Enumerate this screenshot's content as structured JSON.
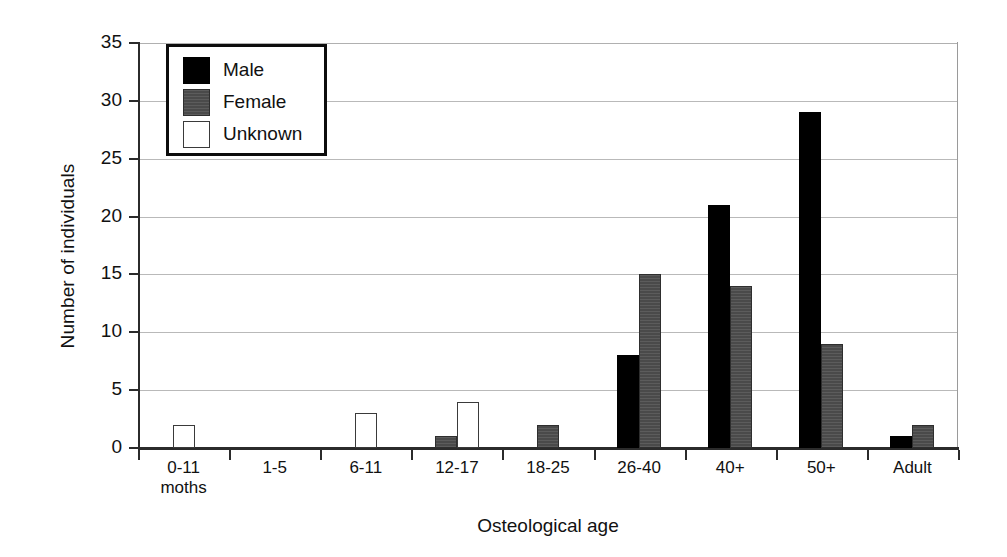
{
  "chart_data": {
    "type": "bar",
    "title": "",
    "xlabel": "Osteological age",
    "ylabel": "Number of individuals",
    "ylim": [
      0,
      35
    ],
    "ytick_labels": [
      "0",
      "5",
      "10",
      "15",
      "20",
      "25",
      "30",
      "35"
    ],
    "ytick_values": [
      0,
      5,
      10,
      15,
      20,
      25,
      30,
      35
    ],
    "grid": "horizontal",
    "legend_position": "top-left",
    "categories": [
      "0-11\nmoths",
      "1-5",
      "6-11",
      "12-17",
      "18-25",
      "26-40",
      "40+",
      "50+",
      "Adult"
    ],
    "category_labels": [
      {
        "line1": "0-11",
        "line2": "moths"
      },
      {
        "line1": "1-5",
        "line2": ""
      },
      {
        "line1": "6-11",
        "line2": ""
      },
      {
        "line1": "12-17",
        "line2": ""
      },
      {
        "line1": "18-25",
        "line2": ""
      },
      {
        "line1": "26-40",
        "line2": ""
      },
      {
        "line1": "40+",
        "line2": ""
      },
      {
        "line1": "50+",
        "line2": ""
      },
      {
        "line1": "Adult",
        "line2": ""
      }
    ],
    "series": [
      {
        "name": "Male",
        "color": "#000000",
        "values": [
          0,
          0,
          0,
          0,
          0,
          8,
          21,
          29,
          1
        ]
      },
      {
        "name": "Female",
        "color": "#4a4a4a",
        "values": [
          0,
          0,
          0,
          1,
          2,
          15,
          14,
          9,
          2
        ]
      },
      {
        "name": "Unknown",
        "color": "#ffffff",
        "values": [
          2,
          0,
          3,
          4,
          0,
          0,
          0,
          0,
          0
        ]
      }
    ]
  },
  "legend": {
    "items": [
      {
        "label": "Male",
        "key": "male"
      },
      {
        "label": "Female",
        "key": "female"
      },
      {
        "label": "Unknown",
        "key": "unknown"
      }
    ]
  },
  "axes": {
    "y_title": "Number of individuals",
    "x_title": "Osteological age"
  }
}
